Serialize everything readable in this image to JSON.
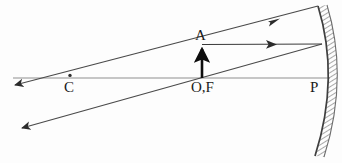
{
  "diagram": {
    "type": "optics-ray-diagram",
    "background_color": "#fdfdfd",
    "stroke_color": "#3a3a3a",
    "axis_color": "#8a8a8a",
    "object_color": "#111111",
    "mirror_color": "#4a4a4a",
    "labels": [
      {
        "id": "A",
        "text": "A",
        "x": 200,
        "y": 35,
        "meaning": "object-tip-A"
      },
      {
        "id": "OF",
        "text": "O,F",
        "x": 203,
        "y": 87,
        "meaning": "pole-and-focus"
      },
      {
        "id": "C",
        "text": "C",
        "x": 70,
        "y": 87,
        "meaning": "centre-of-curvature"
      },
      {
        "id": "P",
        "text": "P",
        "x": 315,
        "y": 87,
        "meaning": "mirror-vertex-P"
      }
    ],
    "principal_axis": {
      "name": "principal-axis",
      "x1": 13,
      "y1": 78,
      "x2": 330,
      "y2": 78
    },
    "object": {
      "name": "object-arrow",
      "base_x": 202,
      "base_y": 78,
      "tip_x": 202,
      "tip_y": 45,
      "height_px": 33
    },
    "point_markers": [
      {
        "name": "centre-of-curvature-dot",
        "x": 70,
        "y": 75,
        "r": 1.7
      }
    ],
    "mirror": {
      "name": "concave-mirror",
      "top_x": 318,
      "top_y": 6,
      "vertex_x": 326,
      "vertex_y": 78,
      "bottom_x": 315,
      "bottom_y": 156,
      "hatch_side": "right",
      "hatch_width": 9
    },
    "rays": [
      {
        "name": "ray-through-A-reflected",
        "kind": "incident-reflected-pair",
        "points": [
          [
            15,
            85
          ],
          [
            318,
            6
          ]
        ],
        "arrow_at": "both",
        "arrow_left": {
          "x": 15,
          "y": 85
        },
        "arrow_mid_right": {
          "x": 275,
          "y": 21
        }
      },
      {
        "name": "ray-through-focus-reflected",
        "kind": "incident-reflected-pair",
        "points": [
          [
            22,
            128
          ],
          [
            322,
            44
          ]
        ],
        "arrow_at": "left",
        "arrow_left": {
          "x": 22,
          "y": 128
        }
      },
      {
        "name": "ray-parallel-from-A",
        "kind": "parallel-incident",
        "points": [
          [
            202,
            45
          ],
          [
            322,
            44
          ]
        ],
        "arrow_at": "right",
        "arrow_mid_right": {
          "x": 272,
          "y": 44
        }
      }
    ]
  }
}
